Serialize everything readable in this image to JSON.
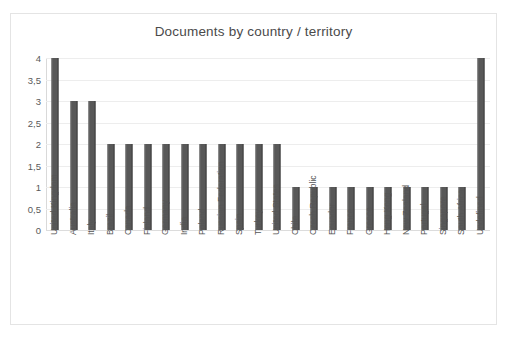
{
  "chart_data": {
    "type": "bar",
    "title": "Documents by country / territory",
    "xlabel": "",
    "ylabel": "",
    "ylim": [
      0,
      4
    ],
    "grid": true,
    "legend": false,
    "y_tick_labels": [
      "0",
      "0,5",
      "1",
      "1,5",
      "2",
      "2,5",
      "3",
      "3,5",
      "4"
    ],
    "y_tick_values": [
      0,
      0.5,
      1,
      1.5,
      2,
      2.5,
      3,
      3.5,
      4
    ],
    "bar_color": "#585858",
    "categories": [
      "United Kingdom",
      "Australia",
      "Italy",
      "Brazil",
      "Canada",
      "Finland",
      "Germany",
      "India",
      "Poland",
      "Russian Federation",
      "Spain",
      "Turkey",
      "United States",
      "Chile",
      "Czech Republic",
      "Ecuador",
      "France",
      "Greece",
      "Hong Kong",
      "New Zealand",
      "Portugal",
      "Singapore",
      "South Africa",
      "Undefined"
    ],
    "values": [
      4,
      3,
      3,
      2,
      2,
      2,
      2,
      2,
      2,
      2,
      2,
      2,
      2,
      1,
      1,
      1,
      1,
      1,
      1,
      1,
      1,
      1,
      1,
      4
    ]
  }
}
